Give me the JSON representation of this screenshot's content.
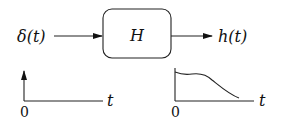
{
  "diagram": {
    "input_label": "δ(t)",
    "system_label": "H",
    "output_label": "h(t)",
    "input_plot": {
      "origin_label": "0",
      "axis_label": "t",
      "description": "impulse at t=0"
    },
    "output_plot": {
      "origin_label": "0",
      "axis_label": "t",
      "description": "decaying impulse response"
    }
  }
}
